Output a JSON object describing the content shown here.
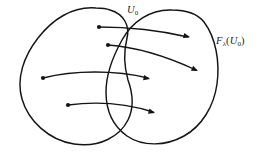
{
  "figure": {
    "kind": "set-mapping-diagram",
    "width": 275,
    "height": 152,
    "background_color": "#ffffff",
    "stroke_color": "#141414"
  },
  "labels": {
    "domain": {
      "base": "U",
      "subscript": "0",
      "full_text": "U0",
      "x": 127,
      "y": 5
    },
    "image": {
      "function": "F",
      "function_subscript": "λ",
      "open_paren": "(",
      "argument": "U",
      "argument_subscript": "0",
      "close_paren": ")",
      "full_text": "Fλ(U0)",
      "x": 216,
      "y": 36
    }
  },
  "regions": [
    {
      "id": "domain-region",
      "name": "left-set",
      "label_ref": "domain",
      "path": "M 96 8 C 72 6 52 20 38 38 C 24 56 16 78 22 99 C 28 120 48 140 74 144 C 100 148 120 136 128 120 C 134 108 133 94 128 80 C 124 66 124 50 127 38 C 130 26 124 14 110 10 C 105 8 100 8 96 8 Z"
    },
    {
      "id": "image-region",
      "name": "right-set",
      "label_ref": "image",
      "path": "M 172 10 C 150 9 132 22 122 40 C 112 58 106 74 106 92 C 106 110 113 126 127 136 C 143 147 166 146 184 136 C 202 126 214 106 217 84 C 220 62 216 38 204 22 C 196 12 184 10 172 10 Z"
    }
  ],
  "arrows": [
    {
      "id": "arrow-1",
      "name": "mapping-arrow-1",
      "source_point": {
        "x": 99,
        "y": 27
      },
      "target_point": {
        "x": 190,
        "y": 37
      },
      "curve": "M 99 27 C 128 27 158 30 188 37"
    },
    {
      "id": "arrow-2",
      "name": "mapping-arrow-2",
      "source_point": {
        "x": 108,
        "y": 45
      },
      "target_point": {
        "x": 198,
        "y": 71
      },
      "curve": "M 108 45 C 136 47 168 57 196 70"
    },
    {
      "id": "arrow-3",
      "name": "mapping-arrow-3",
      "source_point": {
        "x": 43,
        "y": 78
      },
      "target_point": {
        "x": 150,
        "y": 79
      },
      "curve": "M 43 78 C 74 70 116 70 148 78"
    },
    {
      "id": "arrow-4",
      "name": "mapping-arrow-4",
      "source_point": {
        "x": 68,
        "y": 105
      },
      "target_point": {
        "x": 155,
        "y": 113
      },
      "curve": "M 68 105 C 98 101 128 104 153 112"
    }
  ],
  "dot_radius": 2.1,
  "arrow_head_size": 6.5
}
